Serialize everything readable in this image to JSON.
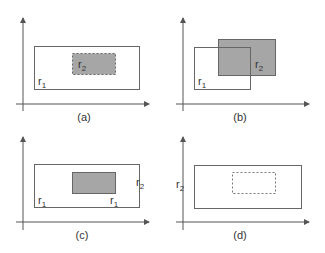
{
  "colors": {
    "axis": "#555555",
    "outline": "#666666",
    "fill": "#a6a6a6",
    "text": "#333333",
    "background": "#ffffff"
  },
  "panels": [
    {
      "id": "a",
      "caption": "(a)",
      "description": "r2 fully contained inside r1 (r2 dashed border)",
      "r1_label": "r",
      "r1_sub": "1",
      "r2_label": "r",
      "r2_sub": "2"
    },
    {
      "id": "b",
      "caption": "(b)",
      "description": "r1 and r2 overlap partially",
      "r1_label": "r",
      "r1_sub": "1",
      "r2_label": "r",
      "r2_sub": "2"
    },
    {
      "id": "c",
      "caption": "(c)",
      "description": "filled rectangle inside r1, r2 label at right edge",
      "r1_label": "r",
      "r1_sub": "1",
      "r1b_label": "r",
      "r1b_sub": "1",
      "r2_label": "r",
      "r2_sub": "2"
    },
    {
      "id": "d",
      "caption": "(d)",
      "description": "empty dashed rectangle inside outer rectangle, r2 label on y-axis",
      "r2_label": "r",
      "r2_sub": "2"
    }
  ]
}
